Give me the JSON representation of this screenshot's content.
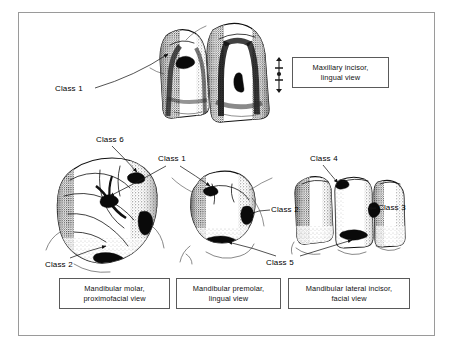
{
  "figure": {
    "frame_color": "#9a9a9a",
    "background": "#ffffff",
    "ink_color": "#111111"
  },
  "captions": [
    {
      "id": "maxillary",
      "line1": "Maxillary incisor,",
      "line2": "lingual view"
    },
    {
      "id": "molar",
      "line1": "Mandibular molar,",
      "line2": "proximofacial view"
    },
    {
      "id": "premolar",
      "line1": "Mandibular premolar,",
      "line2": "lingual view"
    },
    {
      "id": "incisor",
      "line1": "Mandibular lateral incisor,",
      "line2": "facial view"
    }
  ],
  "labels": {
    "class1_maxillary": "Class 1",
    "class6": "Class 6",
    "class1_middle": "Class 1",
    "class4": "Class 4",
    "class3": "Class 3",
    "class2_premolar": "Class 2",
    "class2_molar": "Class 2",
    "class5": "Class 5"
  },
  "drawings": [
    {
      "id": "maxillary-incisor-pair",
      "view": "lingual",
      "teeth": 2
    },
    {
      "id": "mandibular-molar",
      "view": "proximofacial",
      "teeth": 1
    },
    {
      "id": "mandibular-premolar",
      "view": "lingual",
      "teeth": 1
    },
    {
      "id": "mandibular-lateral-incisor",
      "view": "facial",
      "teeth": 3
    }
  ],
  "scale_marker": {
    "present": true,
    "orientation": "vertical"
  }
}
